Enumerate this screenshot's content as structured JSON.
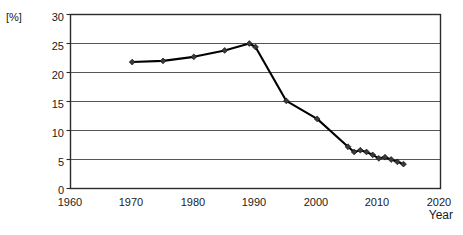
{
  "chart_data": {
    "type": "line",
    "title": "",
    "subtitle": "",
    "xlabel": "Year",
    "ylabel": "[%]",
    "unit_label": "[%]",
    "xlim": [
      1960,
      2020
    ],
    "ylim": [
      0,
      30
    ],
    "xticks": [
      1960,
      1970,
      1980,
      1990,
      2000,
      2010,
      2020
    ],
    "yticks": [
      0,
      5,
      10,
      15,
      20,
      25,
      30
    ],
    "xtick_labels": [
      "1960",
      "1970",
      "1980",
      "1990",
      "2000",
      "2010",
      "2020"
    ],
    "ytick_labels": [
      "0",
      "5",
      "10",
      "15",
      "20",
      "25",
      "30"
    ],
    "grid": "horizontal",
    "legend": "none",
    "marker": "diamond",
    "line_color": "#000000",
    "marker_color": "#3a3a3a",
    "frame_color": "#2b2b2b",
    "gridline_color": "#555555",
    "series": [
      {
        "name": "value",
        "x": [
          1970,
          1975,
          1980,
          1985,
          1989,
          1990,
          1995,
          2000,
          2005,
          2006,
          2007,
          2008,
          2009,
          2010,
          2011,
          2012,
          2013,
          2014
        ],
        "values": [
          21.8,
          22.0,
          22.7,
          23.8,
          25.0,
          24.4,
          15.1,
          12.0,
          7.2,
          6.3,
          6.6,
          6.3,
          5.8,
          5.2,
          5.4,
          5.0,
          4.6,
          4.2
        ]
      }
    ]
  },
  "axes": {
    "y_unit": "[%]",
    "x_title": "Year"
  }
}
